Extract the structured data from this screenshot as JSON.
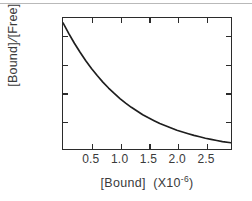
{
  "figure": {
    "background_color": "#ffffff",
    "frame_color": "#2b2b2b",
    "curve_color": "#1e1e1e",
    "top_rule_color": "#b9b9b9"
  },
  "axes": {
    "x": {
      "label_main": "[Bound]",
      "label_unit_prefix": "(X10",
      "label_unit_exponent": "-6",
      "label_unit_suffix": ")",
      "label_full": "[Bound] (X10-6)",
      "ticks": [
        "0.5",
        "1.0",
        "1.5",
        "2.0",
        "2.5"
      ]
    },
    "y": {
      "label_numerator": "[Bound]",
      "label_slash": "/",
      "label_denominator": "[Free]",
      "label_unit_prefix": "(X10",
      "label_unit_exponent": "3",
      "label_unit_suffix": ")",
      "label_full": "[Bound]/[Free] (X103)",
      "ticks": [
        "1.0",
        "2.0",
        "3.0",
        "4.0"
      ]
    }
  },
  "chart_data": {
    "type": "line",
    "title": "",
    "xlabel": "[Bound] (X10^-6)",
    "ylabel": "[Bound]/[Free] (X10^3)",
    "xlim": [
      0.0,
      2.95
    ],
    "ylim": [
      0.0,
      4.62
    ],
    "xticks": [
      0.5,
      1.0,
      1.5,
      2.0,
      2.5
    ],
    "yticks": [
      1.0,
      2.0,
      3.0,
      4.0
    ],
    "grid": false,
    "legend": null,
    "series": [
      {
        "name": "Scatchard decay curve",
        "x": [
          0.0,
          0.1,
          0.2,
          0.3,
          0.4,
          0.5,
          0.6,
          0.7,
          0.8,
          0.9,
          1.0,
          1.1,
          1.2,
          1.3,
          1.4,
          1.5,
          1.6,
          1.7,
          1.8,
          1.9,
          2.0,
          2.1,
          2.2,
          2.3,
          2.4,
          2.5,
          2.6,
          2.7,
          2.8,
          2.95
        ],
        "y": [
          4.45,
          4.08,
          3.73,
          3.41,
          3.11,
          2.84,
          2.59,
          2.36,
          2.15,
          1.96,
          1.78,
          1.62,
          1.47,
          1.34,
          1.21,
          1.1,
          1.0,
          0.9,
          0.82,
          0.74,
          0.66,
          0.6,
          0.54,
          0.48,
          0.43,
          0.38,
          0.34,
          0.3,
          0.26,
          0.22
        ]
      }
    ]
  }
}
